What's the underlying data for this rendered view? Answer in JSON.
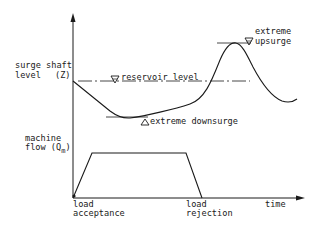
{
  "diagram": {
    "labels": {
      "y_upper_line1": "surge shaft",
      "y_upper_line2": "level",
      "y_upper_symbol": "(Z)",
      "reservoir": "reservoir level",
      "upsurge_line1": "extreme",
      "upsurge_line2": "upsurge",
      "downsurge": "extreme downsurge",
      "y_lower_line1": "machine",
      "y_lower_line2": "flow (Q",
      "y_lower_sub": "m",
      "y_lower_close": ")",
      "x_axis": "time",
      "event1_line1": "load",
      "event1_line2": "acceptance",
      "event2_line1": "load",
      "event2_line2": "rejection"
    },
    "colors": {
      "ink": "#1a1a1a",
      "background": "#ffffff"
    }
  }
}
